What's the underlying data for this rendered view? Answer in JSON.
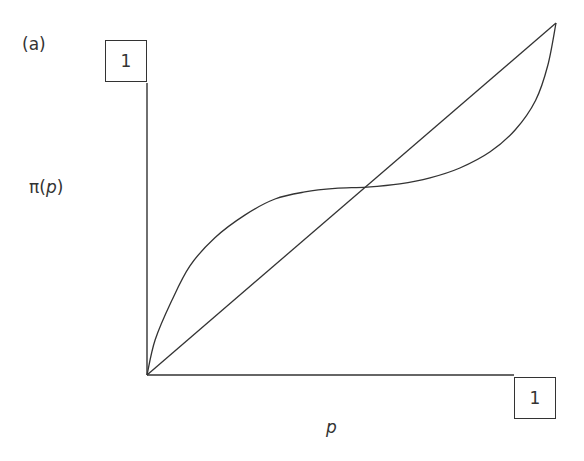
{
  "chart_data": {
    "type": "line",
    "panel_label": "(a)",
    "title": "",
    "xlabel": "p",
    "ylabel": "π(p)",
    "xlim": [
      0,
      1
    ],
    "ylim": [
      0,
      1
    ],
    "x_tick_labels": [
      "1"
    ],
    "y_tick_labels": [
      "1"
    ],
    "grid": false,
    "series": [
      {
        "name": "diagonal",
        "x": [
          0,
          1
        ],
        "y": [
          0,
          1
        ]
      },
      {
        "name": "probability weighting function π(p)",
        "x": [
          0,
          0.02,
          0.06,
          0.105,
          0.166,
          0.24,
          0.313,
          0.386,
          0.46,
          0.538,
          0.618,
          0.692,
          0.765,
          0.839,
          0.9,
          0.95,
          0.98,
          1.0
        ],
        "y": [
          0,
          0.1,
          0.21,
          0.31,
          0.39,
          0.455,
          0.5,
          0.52,
          0.53,
          0.534,
          0.543,
          0.56,
          0.588,
          0.634,
          0.696,
          0.78,
          0.88,
          1.0
        ]
      }
    ],
    "annotations": [
      "curve crosses diagonal near p ≈ 0.54"
    ]
  },
  "labels": {
    "panel": "(a)",
    "y_axis": "π(p)",
    "x_axis": "p",
    "y_tick": "1",
    "x_tick": "1"
  }
}
